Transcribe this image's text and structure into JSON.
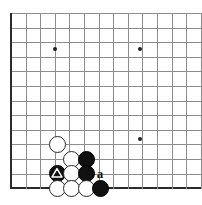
{
  "figure": {
    "name": "go-board-corner-diagram",
    "type": "go-board",
    "width": 202,
    "height": 205,
    "background_color": "#ffffff",
    "grid_color": "#8d8d8d",
    "edge_color": "#2b2b2b"
  },
  "board": {
    "origin_x": 11,
    "origin_y": 13,
    "spacing": 14.6,
    "bottom_edge_y": 188,
    "left_edge_x": 11,
    "columns": 14,
    "rows": 13,
    "corner": "bottom-left",
    "left_edge_is_border": true,
    "bottom_edge_is_border": true
  },
  "star_points": [
    {
      "name": "hoshi-upper-left",
      "x": 55,
      "y": 49
    },
    {
      "name": "hoshi-upper-right",
      "x": 140,
      "y": 49
    },
    {
      "name": "hoshi-lower-right",
      "x": 140,
      "y": 139
    }
  ],
  "stones": [
    {
      "name": "white-stone-1",
      "color": "white",
      "x": 57,
      "y": 144,
      "marker": null
    },
    {
      "name": "white-stone-2",
      "color": "white",
      "x": 71,
      "y": 159,
      "marker": null
    },
    {
      "name": "black-stone-1",
      "color": "black",
      "x": 86,
      "y": 159,
      "marker": null
    },
    {
      "name": "black-stone-marked",
      "color": "black",
      "x": 57,
      "y": 173,
      "marker": "triangle"
    },
    {
      "name": "white-stone-3",
      "color": "white",
      "x": 71,
      "y": 173,
      "marker": null
    },
    {
      "name": "black-stone-2",
      "color": "black",
      "x": 86,
      "y": 173,
      "marker": null
    },
    {
      "name": "white-stone-4",
      "color": "white",
      "x": 57,
      "y": 188,
      "marker": null
    },
    {
      "name": "white-stone-5",
      "color": "white",
      "x": 71,
      "y": 188,
      "marker": null
    },
    {
      "name": "white-stone-6",
      "color": "white",
      "x": 86,
      "y": 188,
      "marker": null
    },
    {
      "name": "black-stone-3",
      "color": "black",
      "x": 100,
      "y": 188,
      "marker": null
    }
  ],
  "point_labels": [
    {
      "name": "point-label-a",
      "text": "a",
      "x": 100,
      "y": 173
    }
  ],
  "colors": {
    "black_stone": "#111111",
    "white_stone": "#ffffff",
    "stone_outline": "#2b2b2b",
    "marker": "#ffffff",
    "label_text": "#111111"
  }
}
